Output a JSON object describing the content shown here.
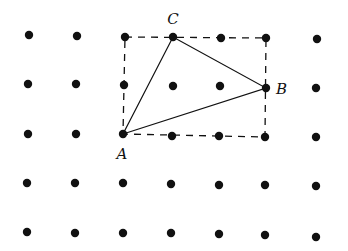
{
  "diagram": {
    "type": "geoboard-lattice-triangle",
    "grid": {
      "columns": 7,
      "rows": 5,
      "dot_color": "#111111",
      "dot_radius": 4.2,
      "points": [
        [
          [
            29,
            35
          ],
          [
            77,
            36
          ],
          [
            125,
            37
          ],
          [
            173,
            37
          ],
          [
            221,
            38
          ],
          [
            266,
            38
          ],
          [
            317,
            39
          ]
        ],
        [
          [
            28,
            84
          ],
          [
            76,
            84
          ],
          [
            124,
            85
          ],
          [
            173,
            86
          ],
          [
            220,
            86
          ],
          [
            266,
            88
          ],
          [
            316,
            88
          ]
        ],
        [
          [
            28,
            134
          ],
          [
            76,
            134
          ],
          [
            123,
            134
          ],
          [
            172,
            136
          ],
          [
            219,
            136
          ],
          [
            265,
            137
          ],
          [
            316,
            137
          ]
        ],
        [
          [
            27,
            183
          ],
          [
            75,
            183
          ],
          [
            123,
            183
          ],
          [
            171,
            184
          ],
          [
            219,
            185
          ],
          [
            265,
            185
          ],
          [
            316,
            186
          ]
        ],
        [
          [
            27,
            232
          ],
          [
            75,
            233
          ],
          [
            123,
            233
          ],
          [
            171,
            233
          ],
          [
            219,
            234
          ],
          [
            265,
            235
          ],
          [
            316,
            237
          ]
        ]
      ]
    },
    "rectangle": {
      "style": "dashed",
      "corners": [
        [
          125,
          37
        ],
        [
          266,
          38
        ],
        [
          265,
          137
        ],
        [
          123,
          134
        ]
      ]
    },
    "triangle": {
      "vertices": {
        "A": [
          123,
          134
        ],
        "B": [
          266,
          88
        ],
        "C": [
          173,
          37
        ]
      }
    },
    "labels": [
      {
        "text": "C",
        "x": 173,
        "y": 24,
        "anchor": "middle"
      },
      {
        "text": "B",
        "x": 276,
        "y": 94,
        "anchor": "start"
      },
      {
        "text": "A",
        "x": 122,
        "y": 159,
        "anchor": "middle"
      }
    ],
    "line_color": "#111111"
  }
}
